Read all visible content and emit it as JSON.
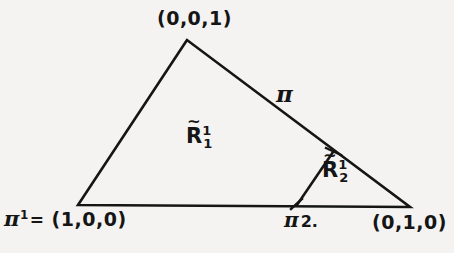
{
  "figure": {
    "kind": "simplex-subdivision-diagram",
    "background_color": "#f4f3f1",
    "stroke_color": "#151515",
    "stroke_width": 2.6,
    "width": 454,
    "height": 253
  },
  "geometry": {
    "apex": [
      187,
      40
    ],
    "left_vertex": [
      78,
      205
    ],
    "right_vertex": [
      410,
      207
    ],
    "base_split_point": [
      297,
      205
    ],
    "edge_split_point": [
      333,
      152
    ],
    "triangle_path": "M 187 40 L 78 205 L 410 207 Z",
    "divider_path": "M 297 205 L 333 152",
    "tick_marks": [
      {
        "name": "tick-base-split",
        "path": "M 291 209 L 302 199"
      },
      {
        "name": "tick-edge-split",
        "path": "M 326 148 L 341 155"
      }
    ]
  },
  "labels": {
    "apex": "(0,0,1)",
    "right_vertex": "(0,1,0)",
    "left_vertex": {
      "pi": "π",
      "superscript": "1",
      "equals": "=",
      "coords": "(1,0,0)"
    },
    "base_split": {
      "pi": "π",
      "superscript": "2."
    },
    "edge_pi": "π",
    "region_1": {
      "letter": "R",
      "tilde": "~",
      "superscript": "1",
      "subscript": "1"
    },
    "region_2": {
      "letter": "R",
      "tilde": "~",
      "superscript": "1",
      "subscript": "2"
    }
  }
}
